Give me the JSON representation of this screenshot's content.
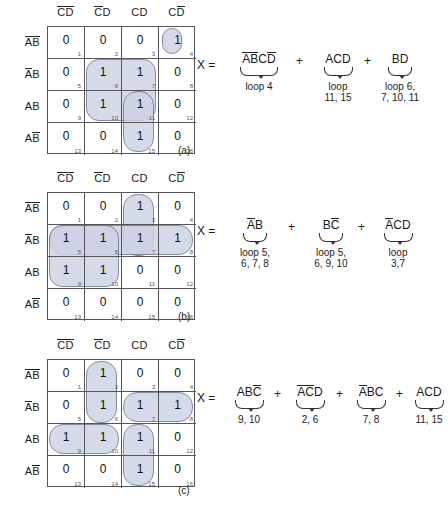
{
  "figure": {
    "colors": {
      "loop_fill": "#ccd2e4",
      "loop_stroke": "#6a7391",
      "grid_line": "#555555",
      "text": "#1a1a1a"
    },
    "col_headers": [
      {
        "c": "C",
        "c_bar": true,
        "d": "D",
        "d_bar": true
      },
      {
        "c": "C",
        "c_bar": true,
        "d": "D",
        "d_bar": false
      },
      {
        "c": "C",
        "c_bar": false,
        "d": "D",
        "d_bar": false
      },
      {
        "c": "C",
        "c_bar": false,
        "d": "D",
        "d_bar": true
      }
    ],
    "row_headers": [
      {
        "a": "A",
        "a_bar": true,
        "b": "B",
        "b_bar": true
      },
      {
        "a": "A",
        "a_bar": true,
        "b": "B",
        "b_bar": false
      },
      {
        "a": "A",
        "a_bar": false,
        "b": "B",
        "b_bar": false
      },
      {
        "a": "A",
        "a_bar": false,
        "b": "B",
        "b_bar": true
      }
    ],
    "cell_numbers": [
      [
        1,
        2,
        3,
        4
      ],
      [
        5,
        6,
        7,
        8
      ],
      [
        9,
        10,
        11,
        12
      ],
      [
        13,
        14,
        15,
        16
      ]
    ],
    "equals_label": "X =",
    "plus_label": "+"
  },
  "maps": [
    {
      "id": "a",
      "caption": "(a)",
      "values": [
        [
          "0",
          "0",
          "0",
          "1"
        ],
        [
          "0",
          "1",
          "1",
          "0"
        ],
        [
          "0",
          "1",
          "1",
          "0"
        ],
        [
          "0",
          "0",
          "1",
          "0"
        ]
      ],
      "ones": [
        4,
        6,
        7,
        10,
        11,
        15
      ],
      "terms": [
        {
          "expr": "ABCD",
          "bars": [
            true,
            true,
            false,
            true
          ],
          "label": "loop 4"
        },
        {
          "expr": "ACD",
          "bars": [
            false,
            false,
            false
          ],
          "label": "loop\n11, 15"
        },
        {
          "expr": "BD",
          "bars": [
            false,
            false
          ],
          "label": "loop 6,\n7, 10, 11"
        }
      ]
    },
    {
      "id": "b",
      "caption": "(b)",
      "values": [
        [
          "0",
          "0",
          "1",
          "0"
        ],
        [
          "1",
          "1",
          "1",
          "1"
        ],
        [
          "1",
          "1",
          "0",
          "0"
        ],
        [
          "0",
          "0",
          "0",
          "0"
        ]
      ],
      "ones": [
        3,
        5,
        6,
        7,
        8,
        9,
        10
      ],
      "terms": [
        {
          "expr": "AB",
          "bars": [
            true,
            false
          ],
          "label": "loop 5,\n6, 7, 8"
        },
        {
          "expr": "BC",
          "bars": [
            false,
            true
          ],
          "label": "loop 5,\n6, 9, 10"
        },
        {
          "expr": "ACD",
          "bars": [
            true,
            false,
            false
          ],
          "label": "loop\n3,7"
        }
      ]
    },
    {
      "id": "c",
      "caption": "(c)",
      "values": [
        [
          "0",
          "1",
          "0",
          "0"
        ],
        [
          "0",
          "1",
          "1",
          "1"
        ],
        [
          "1",
          "1",
          "1",
          "0"
        ],
        [
          "0",
          "0",
          "1",
          "0"
        ]
      ],
      "ones": [
        2,
        6,
        7,
        8,
        9,
        10,
        11,
        15
      ],
      "terms": [
        {
          "expr": "ABC",
          "bars": [
            false,
            false,
            true
          ],
          "label": "9, 10"
        },
        {
          "expr": "ACD",
          "bars": [
            true,
            true,
            false
          ],
          "label": "2, 6"
        },
        {
          "expr": "ABC",
          "bars": [
            true,
            false,
            false
          ],
          "label": "7, 8"
        },
        {
          "expr": "ACD",
          "bars": [
            false,
            false,
            false
          ],
          "label": "11, 15"
        }
      ]
    }
  ]
}
